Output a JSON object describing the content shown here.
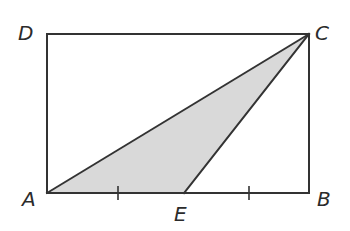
{
  "diagram": {
    "type": "geometry",
    "colors": {
      "line": "#333333",
      "shade": "#d9d9d9",
      "label": "#2b2b2b",
      "background": "#ffffff"
    },
    "points": {
      "A": {
        "label": "A",
        "x": 47,
        "y": 193
      },
      "B": {
        "label": "B",
        "x": 309,
        "y": 193
      },
      "C": {
        "label": "C",
        "x": 309,
        "y": 34
      },
      "D": {
        "label": "D",
        "x": 47,
        "y": 34
      },
      "E": {
        "label": "E",
        "x": 184,
        "y": 193
      }
    },
    "labels": {
      "A": "A",
      "B": "B",
      "C": "C",
      "D": "D",
      "E": "E"
    },
    "shapes": [
      {
        "name": "rectangle",
        "vertices": [
          "A",
          "B",
          "C",
          "D"
        ],
        "filled": false
      },
      {
        "name": "triangle",
        "vertices": [
          "A",
          "E",
          "C"
        ],
        "filled": true
      }
    ],
    "segments": [
      {
        "from": "A",
        "to": "C"
      },
      {
        "from": "E",
        "to": "C"
      }
    ],
    "tick_marks": [
      {
        "segment": "AE",
        "x": 118,
        "y": 193,
        "count": 1
      },
      {
        "segment": "EB",
        "x": 249,
        "y": 193,
        "count": 1
      }
    ]
  }
}
